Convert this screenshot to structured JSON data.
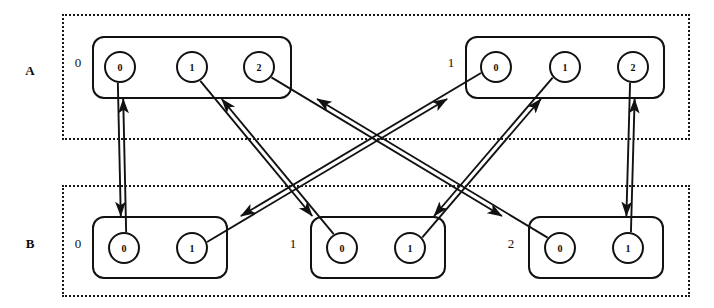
{
  "diagram": {
    "stroke_color": "#111111",
    "background_color": "#ffffff"
  },
  "layers": [
    {
      "label": "A",
      "label_name": "layer-label-a",
      "groups": [
        {
          "index": "0",
          "nodes": [
            {
              "label": "0"
            },
            {
              "label": "1"
            },
            {
              "label": "2"
            }
          ]
        },
        {
          "index": "1",
          "nodes": [
            {
              "label": "0"
            },
            {
              "label": "1"
            },
            {
              "label": "2"
            }
          ]
        }
      ]
    },
    {
      "label": "B",
      "label_name": "layer-label-b",
      "groups": [
        {
          "index": "0",
          "nodes": [
            {
              "label": "0"
            },
            {
              "label": "1"
            }
          ]
        },
        {
          "index": "1",
          "nodes": [
            {
              "label": "0"
            },
            {
              "label": "1"
            }
          ]
        },
        {
          "index": "2",
          "nodes": [
            {
              "label": "0"
            },
            {
              "label": "1"
            }
          ]
        }
      ]
    }
  ],
  "edges": [
    {
      "from": "A.0.0",
      "to": "B.0.0",
      "bidirectional": true
    },
    {
      "from": "A.0.1",
      "to": "B.1.0",
      "bidirectional": true
    },
    {
      "from": "A.0.2",
      "to": "B.2.0",
      "bidirectional": true
    },
    {
      "from": "A.1.0",
      "to": "B.0.1",
      "bidirectional": true
    },
    {
      "from": "A.1.1",
      "to": "B.1.1",
      "bidirectional": true
    },
    {
      "from": "A.1.2",
      "to": "B.2.1",
      "bidirectional": true
    }
  ]
}
